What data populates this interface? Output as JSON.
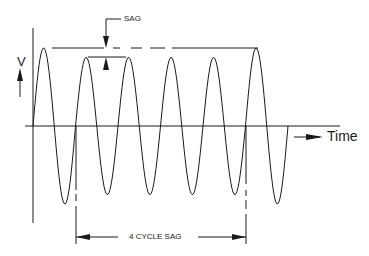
{
  "diagram": {
    "labels": {
      "y_axis": "V",
      "x_axis": "Time",
      "sag": "SAG",
      "duration": "4 CYCLE SAG"
    },
    "waveform": {
      "type": "sinusoid",
      "cycles_total": 6,
      "nominal_peak_rel": 1.0,
      "sag_peak_rel": 0.88,
      "sag_cycles": 4,
      "sag_start_cycle": 2,
      "sag_end_cycle": 5
    },
    "colors": {
      "line": "#1a1a1a",
      "background": "#ffffff"
    }
  }
}
